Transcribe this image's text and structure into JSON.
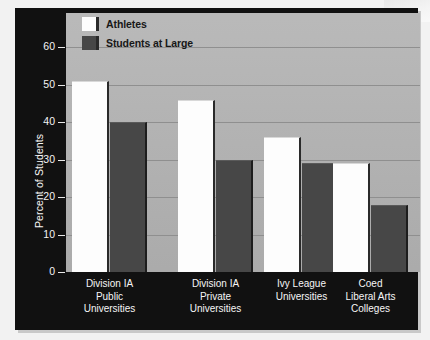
{
  "chart_data": {
    "type": "bar",
    "title": "",
    "xlabel": "",
    "ylabel": "Percent of Students",
    "ylim": [
      0,
      60
    ],
    "yticks": [
      0,
      10,
      20,
      30,
      40,
      50,
      60
    ],
    "grid": true,
    "legend_position": "top-left",
    "categories": [
      "Division IA\nPublic\nUniversities",
      "Division IA\nPrivate\nUniversities",
      "Ivy League\nUniversities",
      "Coed\nLiberal Arts\nColleges"
    ],
    "category_lines": [
      [
        "Division IA",
        "Public",
        "Universities"
      ],
      [
        "Division IA",
        "Private",
        "Universities"
      ],
      [
        "Ivy League",
        "Universities"
      ],
      [
        "Coed",
        "Liberal Arts",
        "Colleges"
      ]
    ],
    "series": [
      {
        "name": "Athletes",
        "color": "#fdfdfd",
        "values": [
          51,
          46,
          36,
          29
        ],
        "data_labels": [
          "51%",
          "46%",
          "36%",
          "29%"
        ]
      },
      {
        "name": "Students at Large",
        "color": "#474747",
        "values": [
          40,
          30,
          29,
          18
        ],
        "data_labels": [
          "40%",
          "30%",
          "29%",
          "18%"
        ]
      }
    ]
  },
  "legend": {
    "items": [
      {
        "label": "Athletes",
        "swatch": "athletes"
      },
      {
        "label": "Students at Large",
        "swatch": "large"
      }
    ]
  },
  "axes": {
    "y_axis_label": "Percent of Students",
    "y_tick_labels": [
      "60",
      "50",
      "40",
      "30",
      "20",
      "10",
      "0"
    ]
  },
  "colors": {
    "frame": "#111111",
    "plot_background": "#b4b4b4",
    "gridline": "#8f8f8f",
    "athletes_bar": "#fdfdfd",
    "students_bar": "#474747",
    "axis_text": "#f6f6f6",
    "data_label_text": "#2b2b2b"
  }
}
